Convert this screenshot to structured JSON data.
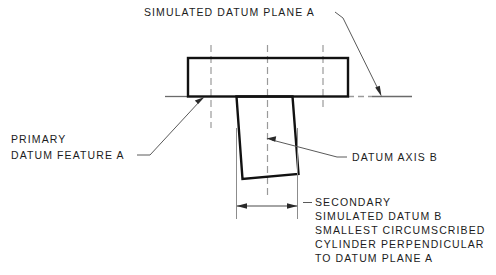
{
  "drawing": {
    "title_label": "SIMULATED DATUM PLANE A",
    "primary_label_line1": "PRIMARY",
    "primary_label_line2": "DATUM FEATURE A",
    "axis_label": "DATUM AXIS B",
    "secondary_block": [
      "SECONDARY",
      "SIMULATED DATUM B",
      "SMALLEST CIRCUMSCRIBED",
      "CYLINDER PERPENDICULAR",
      "TO DATUM PLANE A"
    ],
    "colors": {
      "outline": "#111111",
      "thin_line": "#555555",
      "centerline": "#8a8a8a",
      "text": "#1c1c1c",
      "background": "#ffffff"
    }
  }
}
